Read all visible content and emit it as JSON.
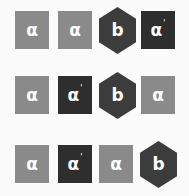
{
  "colors": {
    "light": "#8a8a8a",
    "dark": "#2e2e2e",
    "hex": "#3c3c3c"
  },
  "rows": [
    {
      "tiles": [
        {
          "shape": "square",
          "label": "α",
          "prime": "",
          "tone": "light"
        },
        {
          "shape": "square",
          "label": "α",
          "prime": "",
          "tone": "light"
        },
        {
          "shape": "hexagon",
          "label": "b",
          "prime": "",
          "tone": "hex"
        },
        {
          "shape": "square",
          "label": "α",
          "prime": "'",
          "tone": "dark"
        }
      ]
    },
    {
      "tiles": [
        {
          "shape": "square",
          "label": "α",
          "prime": "",
          "tone": "light"
        },
        {
          "shape": "square",
          "label": "α",
          "prime": "'",
          "tone": "dark"
        },
        {
          "shape": "hexagon",
          "label": "b",
          "prime": "",
          "tone": "hex"
        },
        {
          "shape": "square",
          "label": "α",
          "prime": "",
          "tone": "light"
        }
      ]
    },
    {
      "tiles": [
        {
          "shape": "square",
          "label": "α",
          "prime": "",
          "tone": "light"
        },
        {
          "shape": "square",
          "label": "α",
          "prime": "'",
          "tone": "dark"
        },
        {
          "shape": "square",
          "label": "α",
          "prime": "",
          "tone": "light"
        },
        {
          "shape": "hexagon",
          "label": "b",
          "prime": "",
          "tone": "hex"
        }
      ]
    }
  ]
}
